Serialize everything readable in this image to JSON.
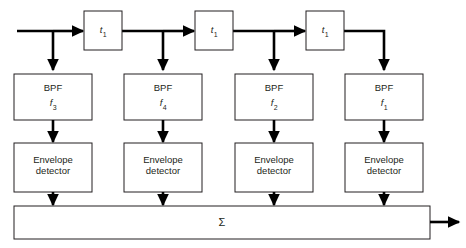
{
  "diagram": {
    "input_label": "",
    "output_label": "",
    "delay_blocks": [
      {
        "id": "delay-1",
        "symbol": "t",
        "subscript": "1"
      },
      {
        "id": "delay-2",
        "symbol": "t",
        "subscript": "1"
      },
      {
        "id": "delay-3",
        "symbol": "t",
        "subscript": "1"
      }
    ],
    "branches": [
      {
        "id": "branch-1",
        "bpf_label": "BPF",
        "bpf_symbol": "f",
        "bpf_subscript": "3",
        "detector_line1": "Envelope",
        "detector_line2": "detector"
      },
      {
        "id": "branch-2",
        "bpf_label": "BPF",
        "bpf_symbol": "f",
        "bpf_subscript": "4",
        "detector_line1": "Envelope",
        "detector_line2": "detector"
      },
      {
        "id": "branch-3",
        "bpf_label": "BPF",
        "bpf_symbol": "f",
        "bpf_subscript": "2",
        "detector_line1": "Envelope",
        "detector_line2": "detector"
      },
      {
        "id": "branch-4",
        "bpf_label": "BPF",
        "bpf_symbol": "f",
        "bpf_subscript": "1",
        "detector_line1": "Envelope",
        "detector_line2": "detector"
      }
    ],
    "summer": {
      "symbol": "Σ"
    },
    "colors": {
      "line": "#000000",
      "box_stroke": "#231f20",
      "box_fill": "#ffffff",
      "text": "#231f20",
      "background": "#ffffff"
    }
  }
}
